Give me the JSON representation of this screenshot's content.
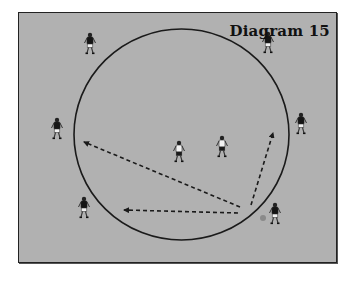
{
  "diagram": {
    "title": "Diagram 15",
    "colors": {
      "field": "#b1b1b1",
      "line": "#1a1a1a",
      "border": "#222222",
      "ball": "#8a8a8a"
    },
    "circle": {
      "cx": 181.5,
      "cy": 134.5,
      "rx": 107.5,
      "ry": 105.5
    },
    "players": [
      {
        "id": "p-top-left",
        "x": 90,
        "y": 45,
        "shirt": "dark"
      },
      {
        "id": "p-top-right",
        "x": 268,
        "y": 44,
        "shirt": "dark"
      },
      {
        "id": "p-left",
        "x": 57,
        "y": 130,
        "shirt": "dark"
      },
      {
        "id": "p-right",
        "x": 301,
        "y": 125,
        "shirt": "dark"
      },
      {
        "id": "p-bottom-left",
        "x": 84,
        "y": 209,
        "shirt": "dark"
      },
      {
        "id": "p-center",
        "x": 179,
        "y": 153,
        "shirt": "light"
      },
      {
        "id": "p-center-right",
        "x": 222,
        "y": 148,
        "shirt": "light"
      },
      {
        "id": "p-bottom-right",
        "x": 275,
        "y": 215,
        "shirt": "dark"
      }
    ],
    "ball": {
      "x": 263,
      "y": 218,
      "r": 3
    },
    "arrows": [
      {
        "id": "pass-left-long",
        "x1": 240,
        "y1": 207,
        "x2": 84,
        "y2": 142
      },
      {
        "id": "pass-left-short",
        "x1": 238,
        "y1": 213,
        "x2": 124,
        "y2": 210
      },
      {
        "id": "pass-up-right",
        "x1": 251,
        "y1": 205,
        "x2": 273,
        "y2": 133
      }
    ]
  }
}
